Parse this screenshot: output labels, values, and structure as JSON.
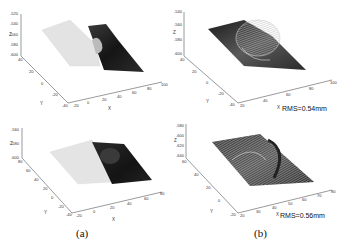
{
  "figure": {
    "captions": [
      "(a)",
      "(b)"
    ],
    "panels": [
      {
        "id": "a-top",
        "z_ticks": [
          "-520",
          "-540",
          "-560",
          "-580",
          "-600"
        ],
        "y_ticks": [
          "40",
          "20",
          "0",
          "-20",
          "-40"
        ],
        "x_ticks": [
          "-20",
          "0",
          "20",
          "40",
          "60",
          "80",
          "100"
        ],
        "xlabel": "X",
        "ylabel": "Y",
        "zlabel": "Z"
      },
      {
        "id": "b-top",
        "z_ticks": [
          "-540",
          "-560",
          "-580",
          "-600"
        ],
        "y_ticks": [
          "40",
          "20",
          "0",
          "-20",
          "-40"
        ],
        "x_ticks": [
          "20",
          "40",
          "60",
          "80",
          "100"
        ],
        "xlabel": "X",
        "ylabel": "Y",
        "zlabel": "Z",
        "rms": "RMS=0.54mm"
      },
      {
        "id": "a-bottom",
        "z_ticks": [
          "-560",
          "-580",
          "-600"
        ],
        "y_ticks": [
          "80",
          "60",
          "40",
          "20",
          "0",
          "-20",
          "-40"
        ],
        "x_ticks": [
          "-20",
          "0",
          "20",
          "40",
          "60",
          "80"
        ],
        "xlabel": "X",
        "ylabel": "Y",
        "zlabel": "Z"
      },
      {
        "id": "b-bottom",
        "z_ticks": [
          "-580",
          "-600",
          "-620",
          "-640"
        ],
        "y_ticks": [
          "60",
          "40",
          "20",
          "0",
          "-20"
        ],
        "x_ticks": [
          "20",
          "30",
          "40",
          "50",
          "60",
          "70",
          "80"
        ],
        "xlabel": "X",
        "ylabel": "Y",
        "zlabel": "Z",
        "rms": "RMS=0.56mm"
      }
    ]
  },
  "colors": {
    "light_surface": "#e2e2e2",
    "dark_surface": "#1a1a1a",
    "axis": "#555555"
  }
}
